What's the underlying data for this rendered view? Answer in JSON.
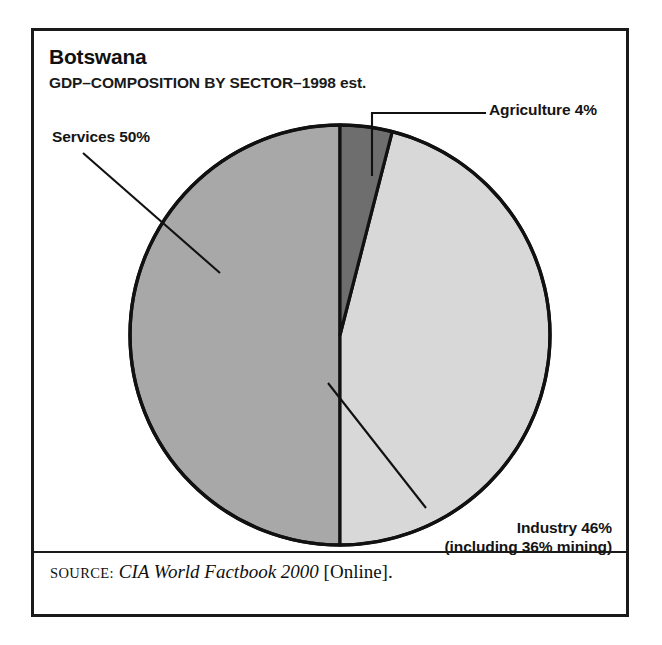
{
  "figure": {
    "title": "Botswana",
    "subtitle": "GDP–COMPOSITION BY SECTOR–1998 est."
  },
  "source": {
    "prefix": "SOURCE:",
    "title": "CIA World Factbook 2000",
    "suffix": "[Online]."
  },
  "labels": {
    "agriculture": "Agriculture 4%",
    "services": "Services 50%",
    "industry_line1": "Industry 46%",
    "industry_line2": "(including 36% mining)"
  },
  "colors": {
    "agriculture": "#6e6e6e",
    "industry": "#d8d8d8",
    "services": "#a8a8a8",
    "outline": "#111111",
    "background": "#ffffff",
    "frame": "#1a1a1a"
  },
  "chart_data": {
    "type": "pie",
    "title": "Botswana",
    "subtitle": "GDP–COMPOSITION BY SECTOR–1998 est.",
    "unit": "percent",
    "start_angle_deg": 0,
    "direction": "clockwise",
    "legend": "callout-labels",
    "grid": false,
    "categories": [
      "Agriculture",
      "Industry",
      "Services"
    ],
    "values": [
      4,
      46,
      50
    ],
    "slices": [
      {
        "name": "Agriculture",
        "value": 4,
        "label": "Agriculture 4%",
        "color": "#6e6e6e",
        "start_deg": 0,
        "end_deg": 14.4
      },
      {
        "name": "Industry",
        "value": 46,
        "label": "Industry 46%",
        "sublabel": "(including 36% mining)",
        "note": "including 36% mining",
        "color": "#d8d8d8",
        "start_deg": 14.4,
        "end_deg": 180
      },
      {
        "name": "Services",
        "value": 50,
        "label": "Services 50%",
        "color": "#a8a8a8",
        "start_deg": 180,
        "end_deg": 360
      }
    ],
    "total": 100
  }
}
